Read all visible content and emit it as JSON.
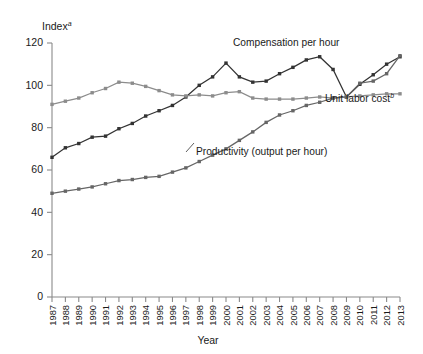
{
  "chart_data": {
    "type": "line",
    "title": "",
    "ylabel": "Index",
    "ylabel_superscript": "a",
    "xlabel": "Year",
    "ylim": [
      0,
      120
    ],
    "yticks": [
      0,
      20,
      40,
      60,
      80,
      100,
      120
    ],
    "grid": false,
    "legend_position": "inline-annotations",
    "categories": [
      "1987",
      "1988",
      "1989",
      "1990",
      "1991",
      "1992",
      "1993",
      "1994",
      "1995",
      "1996",
      "1997",
      "1998",
      "1999",
      "2000",
      "2001",
      "2002",
      "2003",
      "2004",
      "2005",
      "2006",
      "2007",
      "2008",
      "2009",
      "2010",
      "2011",
      "2012",
      "2013"
    ],
    "series": [
      {
        "name": "Compensation per hour",
        "color": "#333333",
        "annotation": "Compensation per hour",
        "annotation_superscript": "",
        "values": [
          66,
          70.5,
          72.5,
          75.5,
          76,
          79.5,
          82,
          85.5,
          88,
          90.5,
          94.5,
          100,
          104,
          110.5,
          104,
          101.5,
          102,
          105.5,
          108.5,
          112,
          113.5,
          107.5,
          94.5,
          100.5,
          105,
          110,
          113.5
        ]
      },
      {
        "name": "Unit labor cost",
        "color": "#8c8c8c",
        "annotation": "Unit labor cost",
        "annotation_superscript": "b",
        "values": [
          91,
          92.5,
          94,
          96.5,
          98.5,
          101.5,
          101,
          99.5,
          97.5,
          95.5,
          95,
          95.5,
          95,
          96.5,
          97,
          94,
          93.5,
          93.5,
          93.5,
          94,
          94.5,
          94,
          94.5,
          95,
          95.5,
          96,
          96
        ]
      },
      {
        "name": "Productivity (output per hour)",
        "color": "#666666",
        "annotation": "Productivity (output per hour)",
        "annotation_superscript": "",
        "values": [
          49,
          50,
          51,
          52,
          53.5,
          55,
          55.5,
          56.5,
          57,
          59,
          61,
          64,
          67,
          70,
          74,
          78,
          82.5,
          86,
          88,
          90.5,
          92,
          94,
          94.5,
          101,
          102,
          105.5,
          114
        ]
      }
    ]
  }
}
